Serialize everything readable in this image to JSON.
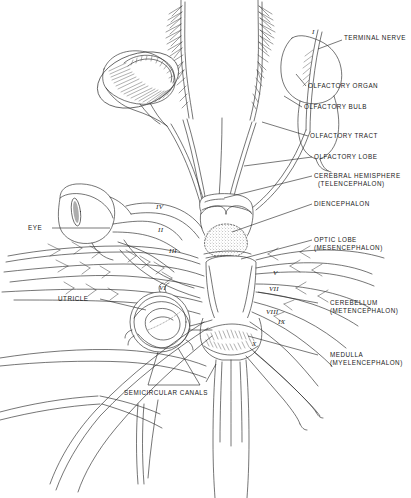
{
  "figure": {
    "ink_color": "#2b2b2b",
    "background_color": "#ffffff",
    "text_color": "#1a1a1a"
  },
  "labels": {
    "terminal_nerve": "TERMINAL NERVE",
    "olfactory_organ": "OLFACTORY ORGAN",
    "olfactory_bulb": "OLFACTORY BULB",
    "olfactory_tract": "OLFACTORY TRACT",
    "olfactory_lobe": "OLFACTORY LOBE",
    "cerebral_hemisphere_1": "CEREBRAL HEMISPHERE",
    "cerebral_hemisphere_2": "(TELENCEPHALON)",
    "diencephalon": "DIENCEPHALON",
    "optic_lobe_1": "OPTIC LOBE",
    "optic_lobe_2": "(MESENCEPHALON)",
    "cerebellum_1": "CEREBELLUM",
    "cerebellum_2": "(METENCEPHALON)",
    "medulla_1": "MEDULLA",
    "medulla_2": "(MYELENCEPHALON)",
    "eye": "EYE",
    "utricle": "UTRICLE",
    "semicircular_canals": "SEMICIRCULAR CANALS"
  },
  "cranial_nerves": {
    "i": "I",
    "ii": "II",
    "iii": "III",
    "iv": "IV",
    "v": "V",
    "vi": "VI",
    "vii": "VII",
    "viii": "VIII",
    "ix": "IX",
    "x": "X"
  }
}
